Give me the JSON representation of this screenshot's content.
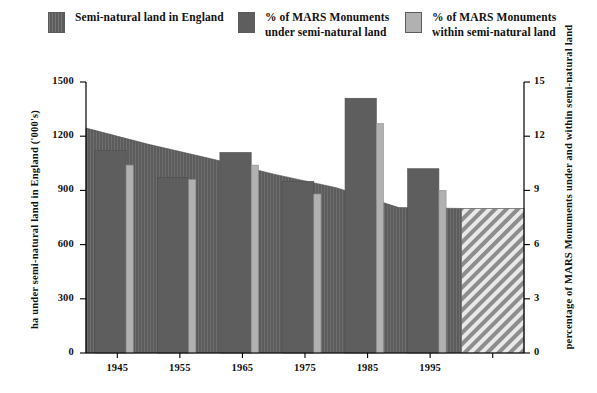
{
  "legend": {
    "items": [
      {
        "label": "Semi-natural land in England",
        "swatch": "area-hatch-dark-gray",
        "color": "#5c5c5c"
      },
      {
        "label": "% of MARS Monuments\nunder semi-natural land",
        "swatch": "solid-dark-gray",
        "color": "#5e5e5e"
      },
      {
        "label": "% of MARS Monuments\nwithin semi-natural land",
        "swatch": "solid-light-gray",
        "color": "#b1b1b1"
      }
    ]
  },
  "axes": {
    "left": {
      "title": "ha under semi-natural land in England ('000's)",
      "ticks": [
        "0",
        "300",
        "600",
        "900",
        "1200",
        "1500"
      ],
      "min": 0,
      "max": 1500
    },
    "right": {
      "title": "percentage of MARS Monuments under and within semi-natural land",
      "ticks": [
        "0",
        "3",
        "6",
        "9",
        "12",
        "15"
      ],
      "min": 0,
      "max": 15
    },
    "x": {
      "ticks": [
        "1945",
        "1955",
        "1965",
        "1975",
        "1985",
        "1995"
      ]
    }
  },
  "chart_data": {
    "type": "bar",
    "title": "",
    "xlabel": "",
    "ylabel": "ha under semi-natural land in England ('000's)",
    "ylabel_right": "percentage of MARS Monuments under and within semi-natural land",
    "ylim": [
      0,
      1500
    ],
    "ylim_right": [
      0,
      15
    ],
    "grid": false,
    "legend_position": "top",
    "categories": [
      "1945",
      "1955",
      "1965",
      "1975",
      "1985",
      "1995"
    ],
    "series": [
      {
        "name": "Semi-natural land in England",
        "type": "area",
        "axis": "left",
        "units": "ha ('000's)",
        "color": "#5c5c5c",
        "fill": "vertical-hatch",
        "values": [
          1245,
          1155,
          1075,
          990,
          915,
          805
        ],
        "extends_to_projection": true,
        "projection_value": 800
      },
      {
        "name": "% of MARS Monuments under semi-natural land",
        "type": "bar",
        "axis": "right",
        "units": "%",
        "color": "#5e5e5e",
        "values": [
          11.2,
          9.7,
          11.1,
          9.5,
          14.1,
          10.2
        ]
      },
      {
        "name": "% of MARS Monuments within semi-natural land",
        "type": "bar",
        "axis": "right",
        "units": "%",
        "color": "#b1b1b1",
        "values": [
          10.4,
          9.6,
          10.4,
          8.8,
          12.7,
          9.0
        ]
      }
    ],
    "projection_block": {
      "label": "projection",
      "fill": "diagonal-hatch",
      "value_right_axis": 8.0,
      "start_category": "after-1995"
    }
  }
}
